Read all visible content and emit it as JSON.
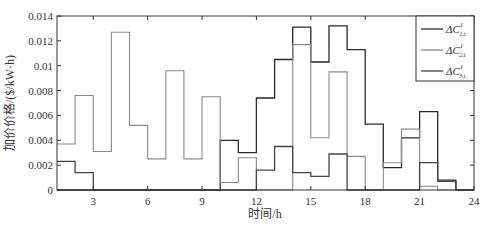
{
  "chart_data": {
    "type": "line",
    "subtype": "step",
    "title": "",
    "xlabel": "时间/h",
    "ylabel": "加价价格/($/kW·h)",
    "xlim": [
      1,
      24
    ],
    "ylim": [
      0,
      0.014
    ],
    "xticks": [
      3,
      6,
      9,
      12,
      15,
      18,
      21,
      24
    ],
    "yticks": [
      0,
      0.002,
      0.004,
      0.006,
      0.008,
      0.01,
      0.012,
      0.014
    ],
    "ytick_labels": [
      "0",
      "0.002",
      "0.004",
      "0.006",
      "0.008",
      "0.01",
      "0.012",
      "0.014"
    ],
    "grid": false,
    "legend_position": "upper right",
    "x": [
      1,
      2,
      3,
      4,
      5,
      6,
      7,
      8,
      9,
      10,
      11,
      12,
      13,
      14,
      15,
      16,
      17,
      18,
      19,
      20,
      21,
      22,
      23
    ],
    "series": [
      {
        "name": "ΔC¹₁,t",
        "legend_base": "ΔC",
        "legend_sup": "1",
        "legend_sub": "1,t",
        "color": "#2a2a2a",
        "values": [
          0,
          0,
          0,
          0,
          0,
          0,
          0,
          0,
          0,
          0.004,
          0.003,
          0.0074,
          0.0105,
          0.0131,
          0.0103,
          0.0132,
          0.0113,
          0.0053,
          0.0018,
          0.0042,
          0.0063,
          0.0008,
          0
        ]
      },
      {
        "name": "ΔC¹₂,t",
        "legend_base": "ΔC",
        "legend_sup": "1",
        "legend_sub": "2,t",
        "color": "#8a8a8a",
        "values": [
          0.0037,
          0.0076,
          0.0031,
          0.0127,
          0.0052,
          0.0025,
          0.0096,
          0.0025,
          0.0075,
          0.0006,
          0.0026,
          0,
          0,
          0.0117,
          0.0042,
          0.0095,
          0.0027,
          0,
          0.0022,
          0.0049,
          0.0003,
          0,
          0
        ]
      },
      {
        "name": "ΔC¹₃,t",
        "legend_base": "ΔC",
        "legend_sup": "1",
        "legend_sub": "3,t",
        "color": "#444444",
        "values": [
          0.0023,
          0.0014,
          0,
          0,
          0,
          0,
          0,
          0,
          0,
          0,
          0,
          0.0016,
          0.0035,
          0.0014,
          0.0011,
          0.0029,
          0,
          0,
          0,
          0,
          0.0022,
          0.0007,
          0
        ]
      }
    ]
  }
}
